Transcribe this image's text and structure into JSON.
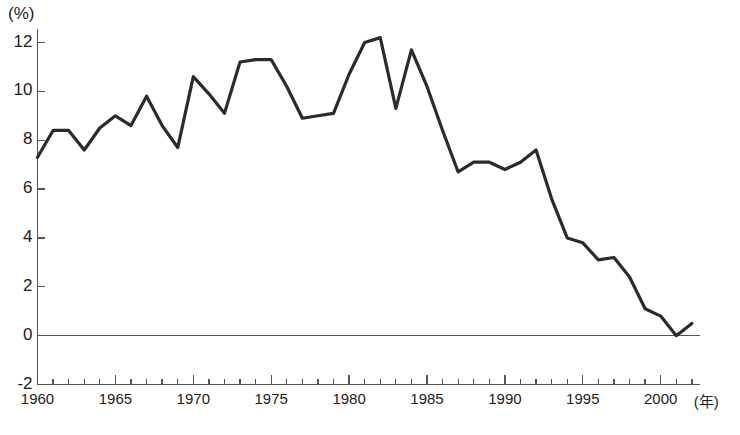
{
  "chart_data": {
    "type": "line",
    "title": "",
    "subtitle": "",
    "xlabel": "年",
    "ylabel": "(%)",
    "xlim": [
      1960,
      2002
    ],
    "ylim": [
      -2,
      13
    ],
    "grid": false,
    "legend": null,
    "y_ticks": [
      -2,
      0,
      2,
      4,
      6,
      8,
      10,
      12
    ],
    "y_tick_labels": [
      "-2",
      "0",
      "2",
      "4",
      "6",
      "8",
      "10",
      "12"
    ],
    "x_ticks": [
      1960,
      1965,
      1970,
      1975,
      1980,
      1985,
      1990,
      1995,
      2000
    ],
    "x_tick_labels": [
      "1960",
      "1965",
      "1970",
      "1975",
      "1980",
      "1985",
      "1990",
      "1995",
      "2000"
    ],
    "x_minor_tick_interval": 1,
    "zero_line": 0,
    "line_color": "#2b2b2b",
    "line_width": 3.2,
    "axis_color": "#555555",
    "x": [
      1960,
      1961,
      1962,
      1963,
      1964,
      1965,
      1966,
      1967,
      1968,
      1969,
      1970,
      1971,
      1972,
      1973,
      1974,
      1975,
      1976,
      1977,
      1978,
      1979,
      1980,
      1981,
      1982,
      1983,
      1984,
      1985,
      1986,
      1987,
      1988,
      1989,
      1990,
      1991,
      1992,
      1993,
      1994,
      1995,
      1996,
      1997,
      1998,
      1999,
      2000,
      2001,
      2002
    ],
    "values": [
      7.3,
      8.4,
      8.4,
      7.6,
      8.5,
      9.0,
      8.6,
      9.8,
      8.6,
      7.7,
      10.6,
      9.9,
      9.1,
      11.2,
      11.3,
      11.3,
      10.2,
      8.9,
      9.0,
      9.1,
      10.7,
      12.0,
      12.2,
      9.3,
      11.7,
      10.2,
      8.4,
      6.7,
      7.1,
      7.1,
      6.8,
      7.1,
      7.6,
      5.6,
      4.0,
      3.8,
      3.1,
      3.2,
      2.4,
      1.1,
      0.8,
      0.0,
      0.5
    ]
  },
  "annotations": {
    "unit_label": "(%)",
    "x_unit_label": "(年)",
    "caption_partial": ""
  }
}
